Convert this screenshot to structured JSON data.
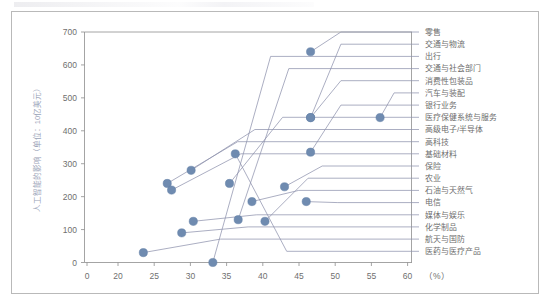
{
  "chart_data": {
    "type": "scatter",
    "title": "",
    "subtitle": "",
    "xlabel": "",
    "ylabel": "人工智能的影响（单位：10亿美元）",
    "x_unit": "（%）",
    "xlim": [
      0,
      60
    ],
    "ylim": [
      0,
      700
    ],
    "x_ticks": [
      "0",
      "20",
      "25",
      "30",
      "35",
      "40",
      "45",
      "50",
      "55",
      "60"
    ],
    "x_tick_values": [
      0,
      20,
      25,
      30,
      35,
      40,
      45,
      50,
      55,
      60
    ],
    "x_axis_broken": true,
    "y_ticks": [
      "0",
      "100",
      "200",
      "300",
      "400",
      "500",
      "600",
      "700"
    ],
    "y_tick_values": [
      0,
      100,
      200,
      300,
      400,
      500,
      600,
      700
    ],
    "grid": false,
    "legend_position": "right-labels-with-leader-lines",
    "marker_color": "#6f8bb0",
    "leader_color": "#8f93ad",
    "points": [
      {
        "label": "零售",
        "x": 46.6,
        "y": 640,
        "leader_y": 700
      },
      {
        "label": "交通与物流",
        "x": 46.6,
        "y": 440,
        "leader_y": 663
      },
      {
        "label": "出行",
        "x": 33.1,
        "y": 0,
        "leader_y": 626
      },
      {
        "label": "交通与社会部门",
        "x": 36.6,
        "y": 130,
        "leader_y": 589
      },
      {
        "label": "消费性包装品",
        "x": 46.6,
        "y": 440,
        "leader_y": 552
      },
      {
        "label": "汽车与装配",
        "x": 56.2,
        "y": 440,
        "leader_y": 515
      },
      {
        "label": "银行业务",
        "x": 46.6,
        "y": 335,
        "leader_y": 478
      },
      {
        "label": "医疗保健系统与服务",
        "x": 35.4,
        "y": 240,
        "leader_y": 441
      },
      {
        "label": "高级电子/半导体",
        "x": 30.1,
        "y": 280,
        "leader_y": 404
      },
      {
        "label": "高科技",
        "x": 26.8,
        "y": 240,
        "leader_y": 367
      },
      {
        "label": "基础材料",
        "x": 27.4,
        "y": 220,
        "leader_y": 330
      },
      {
        "label": "保险",
        "x": 43.0,
        "y": 230,
        "leader_y": 293
      },
      {
        "label": "农业",
        "x": 40.3,
        "y": 125,
        "leader_y": 256
      },
      {
        "label": "石油与天然气",
        "x": 38.5,
        "y": 185,
        "leader_y": 219
      },
      {
        "label": "电信",
        "x": 46.0,
        "y": 185,
        "leader_y": 182
      },
      {
        "label": "媒体与娱乐",
        "x": 30.4,
        "y": 125,
        "leader_y": 145
      },
      {
        "label": "化学制品",
        "x": 28.8,
        "y": 90,
        "leader_y": 108
      },
      {
        "label": "航天与国防",
        "x": 23.5,
        "y": 30,
        "leader_y": 71
      },
      {
        "label": "医药与医疗产品",
        "x": 36.2,
        "y": 330,
        "leader_y": 34
      }
    ]
  },
  "axis": {
    "y_title": "人工智能的影响（单位：10亿美元）",
    "x_unit_label": "（%）"
  }
}
